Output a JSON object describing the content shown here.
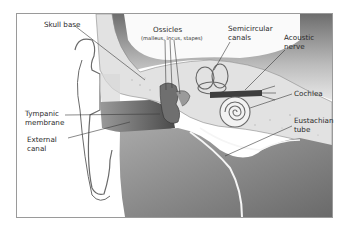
{
  "diagram": {
    "labels": {
      "skull_base": "Skull base",
      "ossicles": "Ossicles",
      "ossicles_detail": "(malleus, incus, stapes)",
      "semicircular_line1": "Semicircular",
      "semicircular_line2": "canals",
      "acoustic_line1": "Acoustic",
      "acoustic_line2": "nerve",
      "cochlea": "Cochlea",
      "tympanic_line1": "Tympanic",
      "tympanic_line2": "membrane",
      "eustachian_line1": "Eustachian",
      "eustachian_line2": "tube",
      "external_line1": "External",
      "external_line2": "canal"
    },
    "colors": {
      "frame": "#9a9a9a",
      "bone": "#e6e6e6",
      "soft_tissue": "#8c8c8c",
      "dark_tissue": "#5a5a5a",
      "cavity": "#d4d4d4",
      "leader": "#3a3a3a"
    }
  }
}
